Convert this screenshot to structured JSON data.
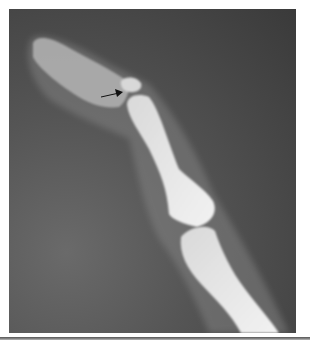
{
  "figure": {
    "annotation": "arrow",
    "colors": {
      "background": "#ffffff",
      "film_dark": "#3a3a3a",
      "bone": "#e6e6e6",
      "soft_tissue": "#7a7a7a",
      "arrow": "#111111",
      "rule": "#666666"
    }
  }
}
